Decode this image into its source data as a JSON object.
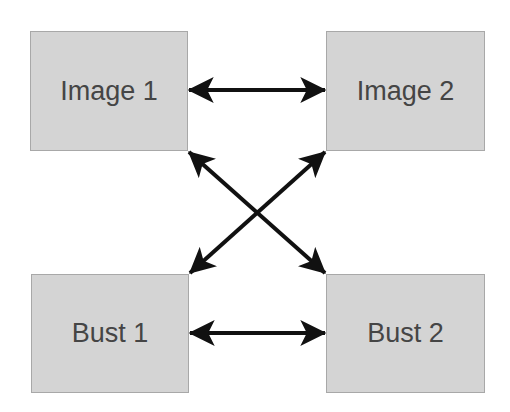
{
  "diagram": {
    "type": "relationship-graph",
    "nodes": [
      {
        "id": "image1",
        "label": "Image 1"
      },
      {
        "id": "image2",
        "label": "Image 2"
      },
      {
        "id": "bust1",
        "label": "Bust 1"
      },
      {
        "id": "bust2",
        "label": "Bust 2"
      }
    ],
    "edges": [
      {
        "from": "image1",
        "to": "image2",
        "direction": "bidirectional"
      },
      {
        "from": "bust1",
        "to": "bust2",
        "direction": "bidirectional"
      },
      {
        "from": "image1",
        "to": "bust2",
        "direction": "bidirectional"
      },
      {
        "from": "image2",
        "to": "bust1",
        "direction": "bidirectional"
      }
    ],
    "colors": {
      "node_fill": "#d4d4d4",
      "node_border": "#a8a8a8",
      "label": "#454545",
      "arrow": "#111111"
    }
  }
}
